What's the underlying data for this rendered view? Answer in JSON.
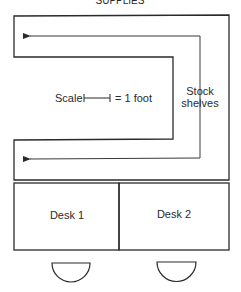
{
  "title": "SUPPLIES",
  "scale": {
    "label": "Scale",
    "equals": "= 1 foot"
  },
  "shelves_label": [
    "Stock",
    "shelves"
  ],
  "desks": [
    {
      "label": "Desk 1"
    },
    {
      "label": "Desk 2"
    }
  ],
  "colors": {
    "line": "#2a2a2a",
    "arrow": "#3a3a3a"
  }
}
